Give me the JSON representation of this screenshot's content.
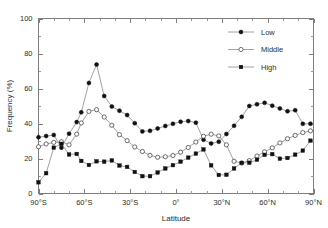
{
  "chart_data": {
    "type": "line",
    "title": "",
    "xlabel": "Latitude",
    "ylabel": "Frequency (%)",
    "xlim": [
      -90,
      90
    ],
    "ylim": [
      0,
      100
    ],
    "grid": false,
    "legend_position": "top-right",
    "xtick_labels": [
      "90°S",
      "60°S",
      "30°S",
      "0°",
      "30°N",
      "60°N",
      "90°N"
    ],
    "xtick_values": [
      -90,
      -60,
      -30,
      0,
      30,
      60,
      90
    ],
    "xtick_minor_step": 10,
    "ytick_labels": [
      "0",
      "20",
      "40",
      "60",
      "80",
      "100"
    ],
    "ytick_values": [
      0,
      20,
      40,
      60,
      80,
      100
    ],
    "ytick_minor_step": 10,
    "x": [
      -90,
      -85,
      -80,
      -75,
      -70,
      -65,
      -62,
      -57,
      -52,
      -47,
      -42,
      -37,
      -32,
      -27,
      -22,
      -17,
      -12,
      -7,
      -2,
      3,
      8,
      13,
      18,
      23,
      28,
      33,
      38,
      43,
      48,
      53,
      58,
      63,
      68,
      73,
      78,
      83,
      88
    ],
    "series": [
      {
        "name": "Low",
        "marker": "filled-circle",
        "color": "#111111",
        "values": [
          32.2,
          32.8,
          33.4,
          26.2,
          34.2,
          40.8,
          46.4,
          63.2,
          73.7,
          55.7,
          49.7,
          47.3,
          44.8,
          40.2,
          35.5,
          35.8,
          37.2,
          38.6,
          39.8,
          41.0,
          41.4,
          40.5,
          30.7,
          28.6,
          29.6,
          34.0,
          38.7,
          43.8,
          50.0,
          51.0,
          51.8,
          50.2,
          48.6,
          47.0,
          47.6,
          39.8,
          39.9
        ]
      },
      {
        "name": "Middle",
        "marker": "open-circle",
        "color": "#4a4a4a",
        "values": [
          26.7,
          28.3,
          29.2,
          29.6,
          27.8,
          33.9,
          40.3,
          46.9,
          47.9,
          43.7,
          39.0,
          33.6,
          30.2,
          26.6,
          24.0,
          21.8,
          20.7,
          21.0,
          21.7,
          23.6,
          26.3,
          29.4,
          32.7,
          33.9,
          32.9,
          27.8,
          18.4,
          17.4,
          18.8,
          21.4,
          23.8,
          26.1,
          28.9,
          31.3,
          33.2,
          34.8,
          35.8
        ]
      },
      {
        "name": "High",
        "marker": "filled-square",
        "color": "#111111",
        "values": [
          6.4,
          11.6,
          26.2,
          28.4,
          22.3,
          22.6,
          18.6,
          16.3,
          18.4,
          18.2,
          18.9,
          16.0,
          15.2,
          12.3,
          9.9,
          9.9,
          12.0,
          14.3,
          16.2,
          18.2,
          20.5,
          22.8,
          25.2,
          16.1,
          10.6,
          10.7,
          14.3,
          17.5,
          17.6,
          19.3,
          22.1,
          22.5,
          19.9,
          20.3,
          22.2,
          24.5,
          30.2
        ]
      }
    ]
  },
  "legend": {
    "items": [
      {
        "label": "Low"
      },
      {
        "label": "Middle"
      },
      {
        "label": "High"
      }
    ]
  }
}
